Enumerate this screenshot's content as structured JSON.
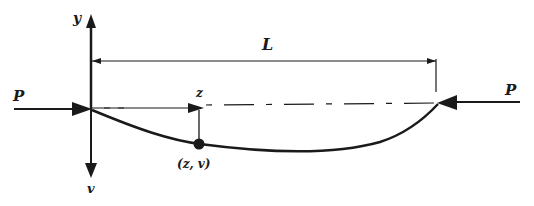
{
  "diagram": {
    "labels": {
      "y_axis": "y",
      "v_axis": "v",
      "length": "L",
      "z_axis": "z",
      "load_left": "P",
      "load_right": "P",
      "point": "(z, v)"
    },
    "colors": {
      "ink": "#1a1a1a",
      "background": "#ffffff"
    }
  }
}
